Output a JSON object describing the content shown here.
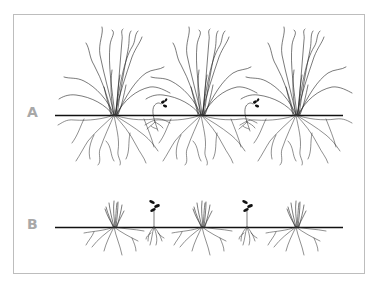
{
  "diagram": {
    "panels": [
      {
        "label": "A",
        "description": "mature grass clumps with extensive roots and seedlings between them"
      },
      {
        "label": "B",
        "description": "smaller grass clumps with seedlings between them"
      }
    ],
    "colors": {
      "frame": "#bdbdbd",
      "label": "#a8a8a8",
      "ink": "#111111"
    }
  }
}
